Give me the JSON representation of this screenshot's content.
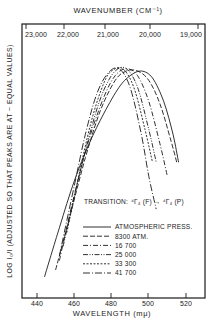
{
  "chart_data": {
    "type": "line",
    "title": "",
    "xlabel": "WAVELENGTH (mμ)",
    "x2label": "WAVENUMBER (CM⁻¹)",
    "ylabel": "LOG I₀/I (ADJUSTED SO THAT PEAKS ARE AT ~ EQUAL VALUES)",
    "xlim": [
      432,
      532
    ],
    "ylim": [
      0,
      1.0
    ],
    "grid": false,
    "legend_position": "lower right inside",
    "x_ticks": [
      "440",
      "460",
      "480",
      "500",
      "520"
    ],
    "x2_ticks": [
      "23,000",
      "22,000",
      "21,000",
      "20,000",
      "19,000"
    ],
    "annotation": "TRANSITION: ⁴Γ₄ (F) → ⁴Γ₄ (P)",
    "series": [
      {
        "name": "ATMOSPHERIC PRESS.",
        "style": "solid",
        "x": [
          444,
          452,
          460,
          468,
          476,
          484,
          490,
          496,
          502,
          508,
          513,
          516
        ],
        "y": [
          0.09,
          0.3,
          0.5,
          0.66,
          0.79,
          0.9,
          0.95,
          0.97,
          0.94,
          0.84,
          0.7,
          0.58
        ]
      },
      {
        "name": "8300 ATM.",
        "style": "long-dash",
        "x": [
          450,
          458,
          466,
          474,
          482,
          488,
          494,
          500,
          506,
          512,
          515
        ],
        "y": [
          0.12,
          0.36,
          0.6,
          0.8,
          0.93,
          0.97,
          0.97,
          0.93,
          0.83,
          0.67,
          0.58
        ]
      },
      {
        "name": "16 700",
        "style": "dash-dot",
        "x": [
          452,
          460,
          468,
          476,
          482,
          488,
          494,
          500,
          506,
          510
        ],
        "y": [
          0.16,
          0.44,
          0.68,
          0.86,
          0.95,
          0.98,
          0.95,
          0.84,
          0.66,
          0.52
        ]
      },
      {
        "name": "25 000",
        "style": "dash-dot-dot",
        "x": [
          454,
          462,
          470,
          476,
          482,
          488,
          494,
          500,
          504
        ],
        "y": [
          0.22,
          0.5,
          0.75,
          0.89,
          0.97,
          0.98,
          0.9,
          0.72,
          0.58
        ]
      },
      {
        "name": "33 300",
        "style": "short-dash",
        "x": [
          456,
          464,
          470,
          476,
          480,
          486,
          492,
          498,
          502
        ],
        "y": [
          0.28,
          0.58,
          0.78,
          0.92,
          0.97,
          0.98,
          0.9,
          0.72,
          0.58
        ]
      },
      {
        "name": "41 700",
        "style": "long-dash-dot",
        "x": [
          452,
          460,
          466,
          472,
          478,
          484,
          490,
          496,
          500,
          504
        ],
        "y": [
          0.18,
          0.48,
          0.7,
          0.87,
          0.96,
          0.98,
          0.9,
          0.7,
          0.52,
          0.38
        ]
      }
    ]
  },
  "labels": {
    "top_axis_title": "WAVENUMBER (CM⁻¹)",
    "bottom_axis_title": "WAVELENGTH (mμ)",
    "y_axis_title": "LOG I₀/I (ADJUSTED SO THAT PEAKS ARE AT ~ EQUAL VALUES)",
    "transition_prefix": "TRANSITION:",
    "transition_formula": "⁴Γ₄ (F) → ⁴Γ₄ (P)"
  },
  "legend": [
    {
      "label": "ATMOSPHERIC PRESS.",
      "dash": ""
    },
    {
      "label": "8300 ATM.",
      "dash": "5,2"
    },
    {
      "label": "16 700",
      "dash": "5,2,1,2"
    },
    {
      "label": "25 000",
      "dash": "5,1.5,1,1.5,1,1.5"
    },
    {
      "label": "33 300",
      "dash": "2,1.5"
    },
    {
      "label": "41 700",
      "dash": "7,2,1,2"
    }
  ]
}
